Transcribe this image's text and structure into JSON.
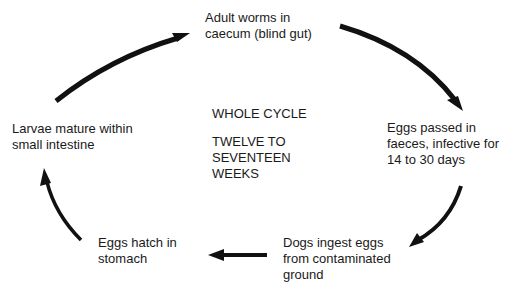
{
  "diagram": {
    "type": "cycle",
    "center": {
      "lines": [
        "WHOLE CYCLE",
        "",
        "TWELVE TO",
        "SEVENTEEN",
        "WEEKS"
      ]
    },
    "stages": [
      {
        "id": "adult-worms",
        "lines": [
          "Adult worms in",
          "caecum (blind gut)"
        ]
      },
      {
        "id": "eggs-passed",
        "lines": [
          "Eggs passed in",
          "faeces, infective for",
          "14 to 30 days"
        ]
      },
      {
        "id": "dogs-ingest",
        "lines": [
          "Dogs ingest eggs",
          "from contaminated",
          "ground"
        ]
      },
      {
        "id": "eggs-hatch",
        "lines": [
          "Eggs hatch in",
          "stomach"
        ]
      },
      {
        "id": "larvae-mature",
        "lines": [
          "Larvae mature within",
          "small intestine"
        ]
      }
    ],
    "arrows": [
      {
        "from": "larvae-mature",
        "to": "adult-worms"
      },
      {
        "from": "adult-worms",
        "to": "eggs-passed"
      },
      {
        "from": "eggs-passed",
        "to": "dogs-ingest"
      },
      {
        "from": "dogs-ingest",
        "to": "eggs-hatch"
      },
      {
        "from": "eggs-hatch",
        "to": "larvae-mature"
      }
    ],
    "colors": {
      "text": "#1a1a1a",
      "arrow": "#111111",
      "background": "#ffffff"
    }
  }
}
